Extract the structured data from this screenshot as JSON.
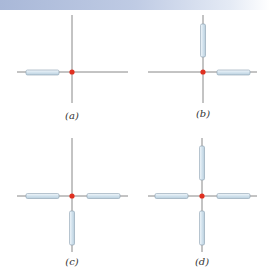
{
  "colors": {
    "axis": "#6b6b6b",
    "rod_fill": "#d8e6f0",
    "rod_stroke": "#8aa0b0",
    "charge": "#e03020",
    "banner_start": "#a9b8d8",
    "banner_end": "#ffffff"
  },
  "panels": [
    {
      "id": "a",
      "label": "(a)",
      "rods": [
        "left"
      ]
    },
    {
      "id": "b",
      "label": "(b)",
      "rods": [
        "up",
        "right"
      ]
    },
    {
      "id": "c",
      "label": "(c)",
      "rods": [
        "left",
        "right",
        "down"
      ]
    },
    {
      "id": "d",
      "label": "(d)",
      "rods": [
        "up",
        "down",
        "left",
        "right"
      ]
    }
  ]
}
